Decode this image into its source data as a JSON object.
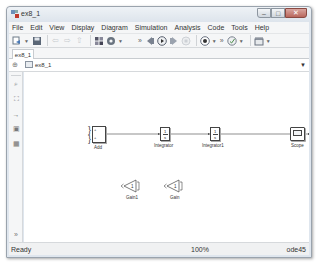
{
  "window": {
    "title": "ex8_1",
    "controls": {
      "minimize": "–",
      "maximize": "□",
      "close": "✕"
    }
  },
  "menubar": {
    "items": [
      {
        "label": "File"
      },
      {
        "label": "Edit"
      },
      {
        "label": "View"
      },
      {
        "label": "Display"
      },
      {
        "label": "Diagram"
      },
      {
        "label": "Simulation"
      },
      {
        "label": "Analysis"
      },
      {
        "label": "Code"
      },
      {
        "label": "Tools"
      },
      {
        "label": "Help"
      }
    ]
  },
  "toolbar": {
    "new_icon": "new-model-icon",
    "save_icon": "save-icon",
    "back_icon": "back-arrow-icon",
    "forward_icon": "forward-arrow-icon",
    "up_icon": "up-arrow-icon",
    "library_icon": "library-browser-icon",
    "settings_icon": "model-config-icon",
    "step_back_icon": "step-back-icon",
    "run_icon": "run-icon",
    "step_forward_icon": "step-forward-icon",
    "stop_icon": "stop-icon",
    "record_icon": "record-icon",
    "advisor_icon": "model-advisor-icon",
    "build_icon": "build-icon",
    "overflow": "»"
  },
  "tabs": [
    {
      "label": "ex8_1"
    }
  ],
  "address_bar": {
    "hide_icon": "⊕",
    "crumb": "ex8_1",
    "dropdown": "▼"
  },
  "sidebar": {
    "buttons": [
      {
        "name": "zoom-icon",
        "glyph": "⌕"
      },
      {
        "name": "fit-view-icon",
        "glyph": "⛶"
      },
      {
        "name": "arrow-icon",
        "glyph": "→"
      },
      {
        "name": "annotation-icon",
        "glyph": "▣"
      },
      {
        "name": "image-icon",
        "glyph": "▦"
      }
    ],
    "expand": "»"
  },
  "diagram": {
    "blocks": {
      "add": {
        "label": "Add",
        "ports": [
          "+",
          "+"
        ]
      },
      "integrator": {
        "label": "Integrator",
        "num": "1",
        "den": "s"
      },
      "integrator1": {
        "label": "Integrator1",
        "num": "1",
        "den": "s"
      },
      "scope": {
        "label": "Scope"
      },
      "gain1": {
        "label": "Gain1",
        "value": "1"
      },
      "gain": {
        "label": "Gain",
        "value": "1"
      }
    }
  },
  "statusbar": {
    "status": "Ready",
    "zoom": "100%",
    "solver": "ode45"
  }
}
